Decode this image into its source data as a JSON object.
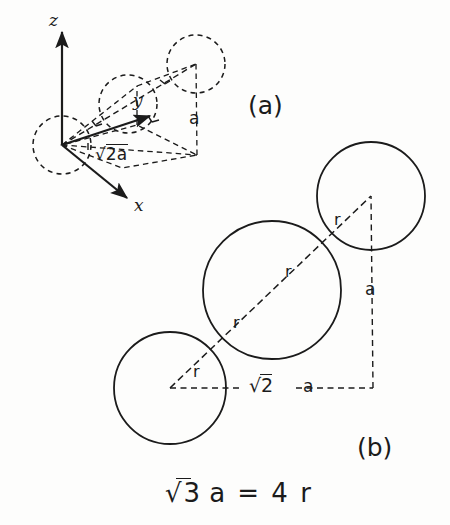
{
  "figure": {
    "background_color": "#fdfdfc",
    "line_color": "#1b1b1b"
  },
  "panel_a": {
    "label": "(a)",
    "axes": [
      {
        "name": "z-axis",
        "label": "z",
        "direction": "up"
      },
      {
        "name": "y-axis",
        "label": "y",
        "direction": "up-right"
      },
      {
        "name": "x-axis",
        "label": "x",
        "direction": "down-right"
      }
    ],
    "dimension_labels": [
      {
        "name": "face-diagonal",
        "text": "√2a",
        "radicand": "2a"
      },
      {
        "name": "cell-edge-vertical",
        "text": "a"
      }
    ],
    "atoms": [
      {
        "name": "corner-atom-origin",
        "style": "dashed"
      },
      {
        "name": "body-center-atom",
        "style": "dashed"
      },
      {
        "name": "corner-atom-far",
        "style": "dashed"
      }
    ]
  },
  "panel_b": {
    "label": "(b)",
    "spheres": [
      {
        "name": "sphere-bottom-left",
        "style": "solid"
      },
      {
        "name": "sphere-middle",
        "style": "solid"
      },
      {
        "name": "sphere-top-right",
        "style": "solid"
      }
    ],
    "radius_labels": [
      {
        "name": "r-label-1",
        "text": "r"
      },
      {
        "name": "r-label-2",
        "text": "r"
      },
      {
        "name": "r-label-3",
        "text": "r"
      },
      {
        "name": "r-label-4",
        "text": "r"
      }
    ],
    "dimension_labels": [
      {
        "name": "face-diagonal",
        "text": "√2",
        "radicand": "2"
      },
      {
        "name": "horizontal-edge",
        "text": "a"
      },
      {
        "name": "vertical-edge",
        "text": "a"
      }
    ]
  },
  "equation": {
    "name": "packing-relation",
    "radical": "√3",
    "radicand": "3",
    "rest": "a  =  4  r",
    "full_text": "√3 a = 4 r"
  }
}
